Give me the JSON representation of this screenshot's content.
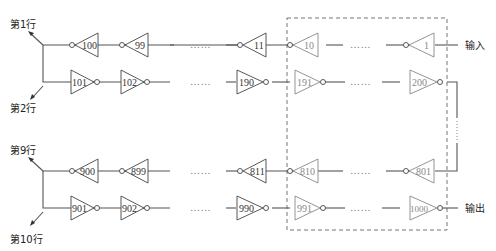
{
  "caption_cutoff": "…………………………………",
  "labels": {
    "row1": "第1行",
    "row2": "第2行",
    "row9": "第9行",
    "row10": "第10行",
    "input": "输入",
    "output": "输出"
  },
  "ellipsis": "……",
  "rows": [
    {
      "name": "row-1",
      "direction": "left",
      "gates": [
        "100",
        "99",
        "11",
        "10",
        "1"
      ]
    },
    {
      "name": "row-2",
      "direction": "right",
      "gates": [
        "101",
        "102",
        "190",
        "191",
        "200"
      ]
    },
    {
      "name": "row-9",
      "direction": "left",
      "gates": [
        "900",
        "899",
        "811",
        "810",
        "801"
      ]
    },
    {
      "name": "row-10",
      "direction": "right",
      "gates": [
        "901",
        "902",
        "990",
        "991",
        "1000"
      ]
    }
  ],
  "colors": {
    "wire": "#555555",
    "dashed_box": "#666666",
    "highlight_gate": "#888888"
  }
}
